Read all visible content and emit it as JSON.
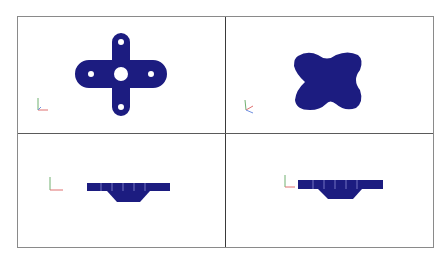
{
  "app": {
    "type": "cad-four-view-layout"
  },
  "colors": {
    "part_fill": "#1c1c80",
    "border": "#8a8a8a",
    "divider": "#3a3a3a",
    "background": "#ffffff",
    "axis_x": "#e07070",
    "axis_y": "#70b070",
    "axis_z": "#7090e0"
  },
  "views": [
    {
      "name": "top-view",
      "shape": "cross-with-holes"
    },
    {
      "name": "isometric-view",
      "shape": "cross-isometric"
    },
    {
      "name": "front-view",
      "shape": "profile"
    },
    {
      "name": "side-view",
      "shape": "profile"
    }
  ],
  "icons": {
    "triad": "axis-triad-icon"
  }
}
